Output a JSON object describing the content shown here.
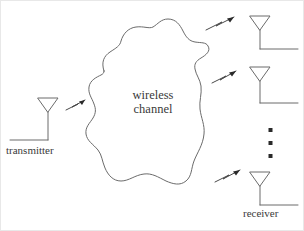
{
  "figure": {
    "width": 304,
    "height": 231,
    "background_color": "#ffffff",
    "stroke_color": "#6b6b6b",
    "text_color": "#3a3a3a"
  },
  "labels": {
    "transmitter": "transmitter",
    "receiver": "receiver",
    "channel_line1": "wireless",
    "channel_line2": "channel"
  },
  "diagram_data": {
    "type": "diagram",
    "elements": [
      {
        "name": "transmitter-antenna",
        "kind": "antenna",
        "label": "transmitter",
        "ground_direction": "left",
        "position": {
          "x": 47,
          "y": 100
        }
      },
      {
        "name": "wireless-channel-cloud",
        "kind": "irregular-blob",
        "label": "wireless channel",
        "position": {
          "x": 152,
          "y": 105
        }
      },
      {
        "name": "receiver-antenna-1",
        "kind": "antenna",
        "ground_direction": "right",
        "position": {
          "x": 260,
          "y": 18
        }
      },
      {
        "name": "receiver-antenna-2",
        "kind": "antenna",
        "ground_direction": "right",
        "position": {
          "x": 260,
          "y": 69
        }
      },
      {
        "name": "receiver-antenna-3",
        "kind": "antenna",
        "label": "receiver",
        "ground_direction": "right",
        "position": {
          "x": 260,
          "y": 174
        }
      },
      {
        "name": "vertical-ellipsis",
        "kind": "ellipsis-dots",
        "count": 3,
        "position": {
          "x": 271,
          "y": 143
        }
      }
    ],
    "signal_arrows": [
      {
        "name": "signal-arrow-transmit",
        "from": "transmitter-antenna",
        "to": "wireless-channel-cloud",
        "direction": "up-right"
      },
      {
        "name": "signal-arrow-receive-1",
        "from": "wireless-channel-cloud",
        "to": "receiver-antenna-1",
        "direction": "up-right"
      },
      {
        "name": "signal-arrow-receive-2",
        "from": "wireless-channel-cloud",
        "to": "receiver-antenna-2",
        "direction": "up-right"
      },
      {
        "name": "signal-arrow-receive-3",
        "from": "wireless-channel-cloud",
        "to": "receiver-antenna-3",
        "direction": "up-right"
      }
    ]
  }
}
